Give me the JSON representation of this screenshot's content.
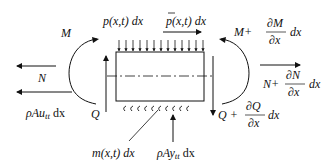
{
  "diagram": {
    "labels": {
      "M_left": "M",
      "N_left": "N",
      "inertia_axial": "ρAu",
      "inertia_axial_sub": "tt",
      "inertia_axial_dx": " dx",
      "Q_left": "Q",
      "p_load": "p(x,t) dx",
      "p_bar_load": "p(x,t) dx",
      "M_right_base": "M+",
      "M_right_num": "∂M",
      "M_right_den": "∂x",
      "M_right_dx": "dx",
      "N_right_base": "N+",
      "N_right_num": "∂N",
      "N_right_den": "∂x",
      "N_right_dx": "dx",
      "Q_right_base": "Q +",
      "Q_right_num": "∂Q",
      "Q_right_den": "∂x",
      "Q_right_dx": "dx",
      "m_load": "m(x,t) dx",
      "inertia_transverse": "ρAy",
      "inertia_transverse_sub": "tt",
      "inertia_transverse_dx": " dx"
    },
    "colors": {
      "stroke": "#111111",
      "background": "#ffffff"
    }
  }
}
